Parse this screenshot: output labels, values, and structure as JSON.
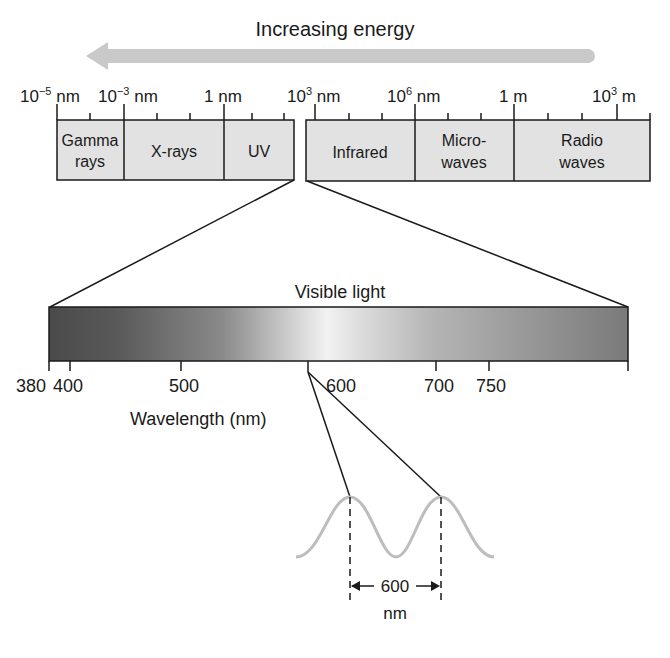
{
  "title": "Increasing energy",
  "spectrum": {
    "scale_labels": [
      {
        "base": "10",
        "exp": "−5",
        "unit": " nm"
      },
      {
        "base": "10",
        "exp": "−3",
        "unit": " nm"
      },
      {
        "base": "1",
        "exp": "",
        "unit": " nm"
      },
      {
        "base": "10",
        "exp": "3",
        "unit": " nm"
      },
      {
        "base": "10",
        "exp": "6",
        "unit": " nm"
      },
      {
        "base": "1",
        "exp": "",
        "unit": " m"
      },
      {
        "base": "10",
        "exp": "3",
        "unit": " m"
      }
    ],
    "bands": [
      {
        "line1": "Gamma",
        "line2": "rays"
      },
      {
        "line1": "X-rays",
        "line2": ""
      },
      {
        "line1": "UV",
        "line2": ""
      },
      {
        "line1": "Infrared",
        "line2": ""
      },
      {
        "line1": "Micro-",
        "line2": "waves"
      },
      {
        "line1": "Radio",
        "line2": "waves"
      }
    ]
  },
  "visible": {
    "label": "Visible light",
    "ticks": [
      "380",
      "400",
      "500",
      "600",
      "700",
      "750"
    ],
    "axis_label": "Wavelength (nm)"
  },
  "wave": {
    "wavelength_value": "600",
    "wavelength_unit": "nm"
  },
  "colors": {
    "arrow": "#c9c9c9",
    "band_fill": "#e2e2e2",
    "line": "#1a1a1a",
    "wave": "#bdbdbd"
  }
}
